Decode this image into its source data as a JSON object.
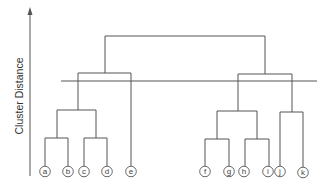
{
  "diagram": {
    "type": "dendrogram",
    "axis_label": "Cluster Distance",
    "leaves": [
      {
        "id": "a",
        "x": 45
      },
      {
        "id": "b",
        "x": 68
      },
      {
        "id": "c",
        "x": 84
      },
      {
        "id": "d",
        "x": 107
      },
      {
        "id": "e",
        "x": 131
      },
      {
        "id": "f",
        "x": 205
      },
      {
        "id": "g",
        "x": 229
      },
      {
        "id": "h",
        "x": 244
      },
      {
        "id": "i",
        "x": 268
      },
      {
        "id": "j",
        "x": 280
      },
      {
        "id": "k",
        "x": 303
      }
    ],
    "merges": [
      {
        "children": [
          "a",
          "b"
        ],
        "level": "low"
      },
      {
        "children": [
          "c",
          "d"
        ],
        "level": "low"
      },
      {
        "children": [
          "f",
          "g"
        ],
        "level": "low"
      },
      {
        "children": [
          "h",
          "i"
        ],
        "level": "low"
      },
      {
        "children": [
          "ab",
          "cd"
        ],
        "level": "mid"
      },
      {
        "children": [
          "fg",
          "hi"
        ],
        "level": "mid"
      },
      {
        "children": [
          "j",
          "k"
        ],
        "level": "mid"
      },
      {
        "children": [
          "abcd",
          "e"
        ],
        "level": "high"
      },
      {
        "children": [
          "fghi",
          "jk"
        ],
        "level": "high"
      },
      {
        "children": [
          "abcde",
          "fghijk"
        ],
        "level": "top"
      }
    ],
    "cut_line": {
      "description": "horizontal cut line yielding two clusters"
    }
  }
}
